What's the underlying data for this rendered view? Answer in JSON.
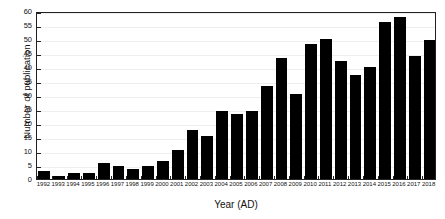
{
  "chart_data": {
    "type": "bar",
    "title": "",
    "subtitle": "",
    "xlabel": "Year (AD)",
    "ylabel": "Number of publication",
    "categories": [
      "1992",
      "1993",
      "1994",
      "1995",
      "1996",
      "1997",
      "1998",
      "1999",
      "2000",
      "2001",
      "2002",
      "2003",
      "2004",
      "2005",
      "2006",
      "2007",
      "2008",
      "2009",
      "2010",
      "2011",
      "2012",
      "2013",
      "2014",
      "2015",
      "2016",
      "2017",
      "2018"
    ],
    "values": [
      3,
      1,
      2,
      2,
      5.6,
      4.7,
      3.7,
      4.6,
      6.6,
      10.5,
      17.4,
      15.4,
      24.4,
      23.3,
      24.3,
      33.3,
      43.2,
      30.3,
      48.2,
      50,
      42,
      37,
      40,
      56,
      58,
      43.8,
      49.6
    ],
    "ylim": [
      0,
      60
    ],
    "yticks": [
      0,
      5,
      10,
      15,
      20,
      25,
      30,
      35,
      40,
      45,
      50,
      55,
      60
    ],
    "ytick_labels": [
      "0",
      "5",
      "10",
      "15",
      "20",
      "25",
      "30",
      "35",
      "40",
      "45",
      "50",
      "55",
      "60"
    ],
    "grid": true,
    "legend": false,
    "legend_position": "none",
    "bar_color": "#000000",
    "grid_color": "#eeeeee",
    "axis_color": "#222222"
  }
}
